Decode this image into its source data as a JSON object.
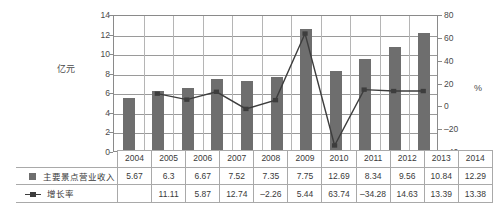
{
  "chart_data": {
    "type": "bar",
    "title": "",
    "xlabel": "",
    "ylabel": "亿元",
    "y2label": "%",
    "categories": [
      "2004",
      "2005",
      "2006",
      "2007",
      "2008",
      "2009",
      "2010",
      "2011",
      "2012",
      "2013",
      "2014"
    ],
    "ylim": [
      0,
      14
    ],
    "y2lim": [
      -40,
      80
    ],
    "yticks": [
      "14",
      "12",
      "10",
      "8",
      "6",
      "4",
      "2",
      "0"
    ],
    "y2ticks": [
      "80",
      "60",
      "40",
      "20",
      "0",
      "-20",
      "-40"
    ],
    "grid": true,
    "legend_position": "table-left",
    "series": [
      {
        "name": "主要景点营业收入",
        "type": "bar",
        "axis": "left",
        "color": "#6e6e6e",
        "marker": "square",
        "values": [
          5.67,
          6.3,
          6.67,
          7.52,
          7.35,
          7.75,
          12.69,
          8.34,
          9.56,
          10.84,
          12.29
        ],
        "labels": [
          "5.67",
          "6.3",
          "6.67",
          "7.52",
          "7.35",
          "7.75",
          "12.69",
          "8.34",
          "9.56",
          "10.84",
          "12.29"
        ]
      },
      {
        "name": "增长率",
        "type": "line",
        "axis": "right",
        "color": "#3d3d3d",
        "marker": "square",
        "values": [
          null,
          11.11,
          5.87,
          12.74,
          -2.26,
          5.44,
          63.74,
          -34.28,
          14.63,
          13.39,
          13.38
        ],
        "labels": [
          "",
          "11.11",
          "5.87",
          "12.74",
          "-2.26",
          "5.44",
          "63.74",
          "-34.28",
          "14.63",
          "13.39",
          "13.38"
        ]
      }
    ]
  },
  "axes": {
    "left_title": "亿元",
    "right_title": "%"
  },
  "table": {
    "year_header": "",
    "years": [
      "2004",
      "2005",
      "2006",
      "2007",
      "2008",
      "2009",
      "2010",
      "2011",
      "2012",
      "2013",
      "2014"
    ],
    "rows": [
      {
        "legend_name": "主要景点营业收入",
        "marker": "square-swatch",
        "values": [
          "5.67",
          "6.3",
          "6.67",
          "7.52",
          "7.35",
          "7.75",
          "12.69",
          "8.34",
          "9.56",
          "10.84",
          "12.29"
        ]
      },
      {
        "legend_name": "增长率",
        "marker": "line-with-square",
        "values": [
          "",
          "11.11",
          "5.87",
          "12.74",
          "-2.26",
          "5.44",
          "63.74",
          "-34.28",
          "14.63",
          "13.39",
          "13.38"
        ]
      }
    ]
  }
}
